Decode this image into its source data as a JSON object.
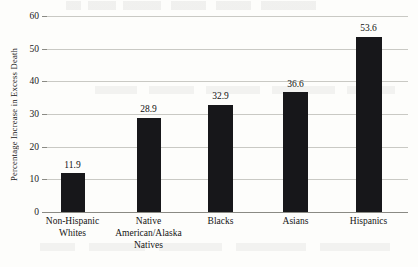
{
  "chart_data": {
    "type": "bar",
    "title": "",
    "xlabel": "",
    "ylabel": "Percentage Increase in Excess Death",
    "categories": [
      "Non-Hispanic\nWhites",
      "Native\nAmerican/Alaska\nNatives",
      "Blacks",
      "Asians",
      "Hispanics"
    ],
    "values": [
      11.9,
      28.9,
      32.9,
      36.6,
      53.6
    ],
    "value_labels": [
      "11.9",
      "28.9",
      "32.9",
      "36.6",
      "53.6"
    ],
    "ylim": [
      0,
      60
    ],
    "yticks": [
      0,
      10,
      20,
      30,
      40,
      50,
      60
    ],
    "ytick_labels": [
      "0",
      "10",
      "20",
      "30",
      "40",
      "50",
      "60"
    ],
    "grid": true,
    "legend": "none",
    "bar_color": "#17171a",
    "gridline_color": "#c9c9c4",
    "axis_color": "#8a8a84",
    "background": "#fdfdfb"
  },
  "bleed_text": {
    "top": "bleed-through artifact",
    "middle": "bleed-through artifact",
    "bottom": "bleed-through artifact"
  }
}
